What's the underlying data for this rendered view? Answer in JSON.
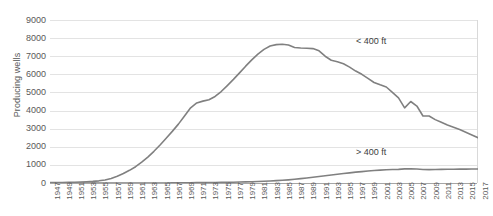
{
  "chart_data": {
    "type": "line",
    "title": "",
    "xlabel": "",
    "ylabel": "Producing wells",
    "ylim": [
      0,
      9000
    ],
    "ytick_step": 1000,
    "yticks": [
      "9000",
      "8000",
      "7000",
      "6000",
      "5000",
      "4000",
      "3000",
      "2000",
      "1000",
      "0"
    ],
    "grid": true,
    "legend_position": "inline-annotation",
    "xlim": [
      1947,
      2017
    ],
    "xtick_step": 2,
    "xticks": [
      "1947",
      "1949",
      "1951",
      "1953",
      "1955",
      "1957",
      "1959",
      "1961",
      "1963",
      "1965",
      "1967",
      "1969",
      "1971",
      "1973",
      "1975",
      "1977",
      "1979",
      "1981",
      "1983",
      "1985",
      "1987",
      "1989",
      "1991",
      "1993",
      "1995",
      "1997",
      "1999",
      "2001",
      "2003",
      "2005",
      "2007",
      "2009",
      "2011",
      "2013",
      "2015",
      "2017"
    ],
    "x": [
      1947,
      1948,
      1949,
      1950,
      1951,
      1952,
      1953,
      1954,
      1955,
      1956,
      1957,
      1958,
      1959,
      1960,
      1961,
      1962,
      1963,
      1964,
      1965,
      1966,
      1967,
      1968,
      1969,
      1970,
      1971,
      1972,
      1973,
      1974,
      1975,
      1976,
      1977,
      1978,
      1979,
      1980,
      1981,
      1982,
      1983,
      1984,
      1985,
      1986,
      1987,
      1988,
      1989,
      1990,
      1991,
      1992,
      1993,
      1994,
      1995,
      1996,
      1997,
      1998,
      1999,
      2000,
      2001,
      2002,
      2003,
      2004,
      2005,
      2006,
      2007,
      2008,
      2009,
      2010,
      2011,
      2012,
      2013,
      2014,
      2015,
      2016,
      2017
    ],
    "series": [
      {
        "name": "< 400 ft",
        "label": "< 400 ft",
        "color": "#808080",
        "values": [
          20,
          25,
          30,
          35,
          45,
          55,
          70,
          90,
          120,
          170,
          250,
          370,
          520,
          700,
          900,
          1150,
          1430,
          1750,
          2100,
          2470,
          2850,
          3250,
          3700,
          4150,
          4420,
          4520,
          4600,
          4780,
          5050,
          5380,
          5720,
          6080,
          6450,
          6800,
          7120,
          7380,
          7560,
          7640,
          7660,
          7620,
          7480,
          7450,
          7440,
          7420,
          7300,
          7000,
          6780,
          6700,
          6580,
          6400,
          6180,
          6000,
          5780,
          5550,
          5420,
          5300,
          5000,
          4700,
          4150,
          4500,
          4250,
          3700,
          3700,
          3500,
          3350,
          3200,
          3080,
          2950,
          2800,
          2650,
          2500
        ]
      },
      {
        "name": "> 400 ft",
        "label": "> 400 ft",
        "color": "#808080",
        "values": [
          0,
          0,
          0,
          0,
          0,
          0,
          0,
          0,
          0,
          0,
          0,
          0,
          0,
          0,
          0,
          0,
          0,
          0,
          2,
          4,
          6,
          8,
          10,
          14,
          18,
          22,
          26,
          30,
          35,
          40,
          45,
          52,
          60,
          70,
          82,
          96,
          112,
          130,
          150,
          175,
          205,
          240,
          280,
          320,
          360,
          400,
          440,
          480,
          520,
          560,
          600,
          630,
          660,
          690,
          710,
          730,
          745,
          755,
          780,
          790,
          770,
          745,
          740,
          745,
          755,
          760,
          762,
          765,
          768,
          770,
          772
        ]
      }
    ]
  }
}
